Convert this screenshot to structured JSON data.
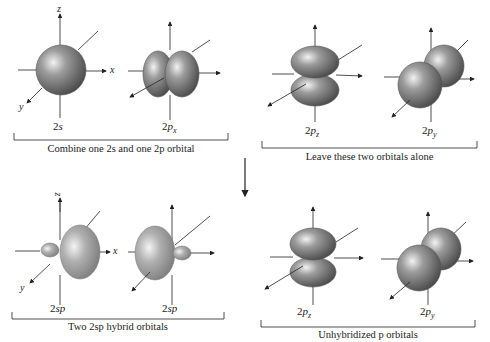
{
  "top_left": {
    "orbitals": [
      {
        "label_main": "2",
        "label_var": "s",
        "label_sub": ""
      },
      {
        "label_main": "2",
        "label_var": "p",
        "label_sub": "x"
      }
    ],
    "caption": "Combine one 2s and one 2p orbital",
    "axes": {
      "z": "z",
      "x": "x",
      "y": "y"
    }
  },
  "top_right": {
    "orbitals": [
      {
        "label_main": "2",
        "label_var": "p",
        "label_sub": "z"
      },
      {
        "label_main": "2",
        "label_var": "p",
        "label_sub": "y"
      }
    ],
    "caption": "Leave these two orbitals alone"
  },
  "bottom_left": {
    "orbitals": [
      {
        "label_main": "2",
        "label_var": "sp",
        "label_sub": ""
      },
      {
        "label_main": "2",
        "label_var": "sp",
        "label_sub": ""
      }
    ],
    "caption": "Two 2sp hybrid orbitals",
    "axes": {
      "z": "z",
      "x": "x",
      "y": "y"
    }
  },
  "bottom_right": {
    "orbitals": [
      {
        "label_main": "2",
        "label_var": "p",
        "label_sub": "z"
      },
      {
        "label_main": "2",
        "label_var": "p",
        "label_sub": "y"
      }
    ],
    "caption": "Unhybridized p orbitals"
  },
  "colors": {
    "orbital_gray": "#7a7a7a",
    "hybrid_gray": "#9a9a9a",
    "line": "#222222"
  }
}
